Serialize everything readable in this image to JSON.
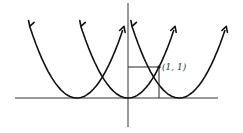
{
  "diagram": {
    "type": "function-graph",
    "curves": [
      {
        "name": "shifted-left",
        "vertex_x": -1.65,
        "vertex_y": 0
      },
      {
        "name": "base",
        "vertex_x": 0,
        "vertex_y": 0
      },
      {
        "name": "shifted-right",
        "vertex_x": 1.65,
        "vertex_y": 0
      }
    ],
    "marked_point": {
      "x": 1,
      "y": 1,
      "label": "(1, 1)"
    },
    "x_range": [
      -4,
      3
    ],
    "y_range": [
      -1,
      4
    ]
  }
}
